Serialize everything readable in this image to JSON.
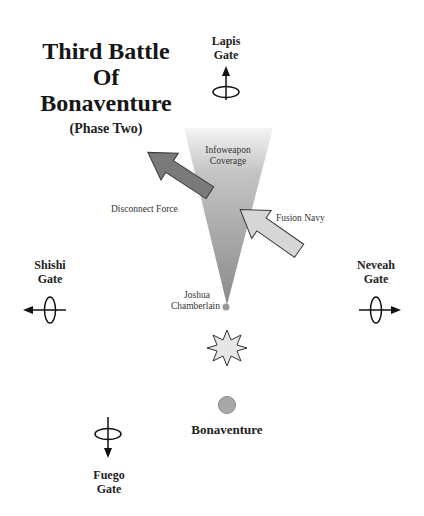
{
  "title": {
    "line1": "Third Battle",
    "line2": "Of",
    "line3": "Bonaventure",
    "subtitle": "(Phase Two)"
  },
  "gates": [
    {
      "name": "Lapis",
      "label": "Gate",
      "direction": "north"
    },
    {
      "name": "Shishi",
      "label": "Gate",
      "direction": "west"
    },
    {
      "name": "Neveah",
      "label": "Gate",
      "direction": "east"
    },
    {
      "name": "Fuego",
      "label": "Gate",
      "direction": "south"
    }
  ],
  "cone": {
    "line1": "Infoweapon",
    "line2": "Coverage"
  },
  "forces": {
    "disconnect": "Disconnect Force",
    "fusion": "Fusion Navy"
  },
  "joshua": {
    "line1": "Joshua",
    "line2": "Chamberlain"
  },
  "planet": "Bonaventure",
  "colors": {
    "disconnect_arrow": "#7a7a7a",
    "fusion_arrow": "#d6d6d6",
    "cone_dark": "#8c8c8c",
    "cone_light": "#f2f2f2",
    "planet": "#a8a8a8",
    "starburst": "#e6e6e6"
  }
}
